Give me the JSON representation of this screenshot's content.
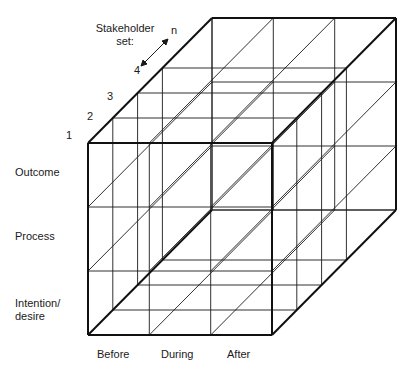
{
  "diagram": {
    "type": "3d-grid-cube",
    "stakeholder_axis": {
      "title_line1": "Stakeholder",
      "title_line2": "set:",
      "levels": [
        "1",
        "2",
        "3",
        "4",
        "n"
      ]
    },
    "vertical_axis": {
      "levels": [
        "Outcome",
        "Process",
        "Intention/",
        "desire"
      ]
    },
    "horizontal_axis": {
      "levels": [
        "Before",
        "During",
        "After"
      ]
    },
    "colors": {
      "line": "#1a1a1a",
      "background": "#ffffff"
    }
  }
}
